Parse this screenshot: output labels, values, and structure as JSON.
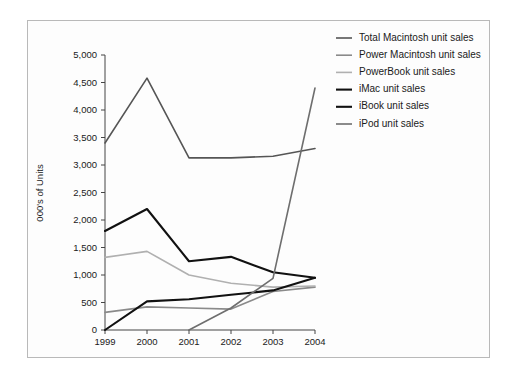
{
  "chart_data": {
    "type": "line",
    "title": "",
    "xlabel": "",
    "ylabel": "000's of Units",
    "categories": [
      "1999",
      "2000",
      "2001",
      "2002",
      "2003",
      "2004"
    ],
    "x": [
      1999,
      2000,
      2001,
      2002,
      2003,
      2004
    ],
    "xlim": [
      1999,
      2004
    ],
    "ylim": [
      0,
      5000
    ],
    "ytick_labels": [
      "0",
      "500",
      "1,000",
      "1,500",
      "2,000",
      "2,500",
      "3,000",
      "3,500",
      "4,000",
      "4,500",
      "5,000"
    ],
    "ytick_values": [
      0,
      500,
      1000,
      1500,
      2000,
      2500,
      3000,
      3500,
      4000,
      4500,
      5000
    ],
    "grid": false,
    "legend_position": "right",
    "series": [
      {
        "name": "Total Macintosh unit sales",
        "color": "#555555",
        "width": 1.6,
        "values": [
          3400,
          4580,
          3130,
          3130,
          3160,
          3300
        ]
      },
      {
        "name": "Power Macintosh unit sales",
        "color": "#8a8a8a",
        "width": 1.6,
        "values": [
          320,
          420,
          400,
          380,
          700,
          780
        ]
      },
      {
        "name": "PowerBook unit sales",
        "color": "#b0b0b0",
        "width": 1.6,
        "values": [
          1320,
          1430,
          1000,
          850,
          780,
          800
        ]
      },
      {
        "name": "iMac unit sales",
        "color": "#111111",
        "width": 2.1,
        "values": [
          1800,
          2200,
          1250,
          1330,
          1050,
          950
        ]
      },
      {
        "name": "iBook unit sales",
        "color": "#111111",
        "width": 2.1,
        "values": [
          0,
          520,
          560,
          640,
          720,
          950
        ]
      },
      {
        "name": "iPod unit sales",
        "color": "#6e6e6e",
        "width": 1.6,
        "values": [
          null,
          null,
          0,
          400,
          940,
          4400
        ]
      }
    ]
  },
  "legend": {
    "items": [
      {
        "label": "Total Macintosh unit sales"
      },
      {
        "label": "Power Macintosh unit sales"
      },
      {
        "label": "PowerBook unit sales"
      },
      {
        "label": "iMac unit sales"
      },
      {
        "label": "iBook unit sales"
      },
      {
        "label": "iPod unit sales"
      }
    ]
  }
}
